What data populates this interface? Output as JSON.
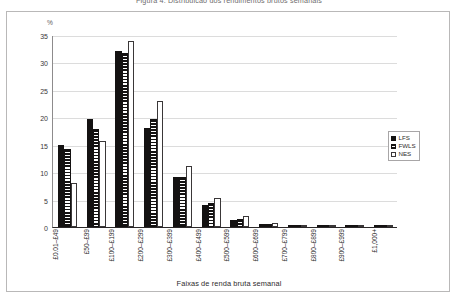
{
  "figure": {
    "title": "Figura 4: Distribuicao dos rendimentos brutos semanais",
    "y_unit_label": "%",
    "x_axis_title": "Faixas de renda bruta semanal"
  },
  "legend": {
    "position": "right",
    "entries": [
      {
        "key": "LFS",
        "label": "LFS",
        "swatch": "solid-black"
      },
      {
        "key": "FWLS",
        "label": "FWLS",
        "swatch": "horizontal-stripes"
      },
      {
        "key": "NES",
        "label": "NES",
        "swatch": "white-outline"
      }
    ]
  },
  "y_ticks": [
    "0",
    "5",
    "10",
    "15",
    "20",
    "25",
    "30",
    "35"
  ],
  "chart_data": {
    "type": "bar",
    "title": "Figura 4: Distribuicao dos rendimentos brutos semanais",
    "xlabel": "Faixas de renda bruta semanal",
    "ylabel": "%",
    "ylim": [
      0,
      35
    ],
    "ytick_step": 5,
    "grid": true,
    "legend_position": "right",
    "categories": [
      "£0.01–£49",
      "£50–£99",
      "£100–£199",
      "£200–£299",
      "£300–£399",
      "£400–£499",
      "£500–£599",
      "£600–£699",
      "£700–£799",
      "£800–£899",
      "£900–£999",
      "£1,000+"
    ],
    "series": [
      {
        "name": "LFS",
        "values": [
          15.0,
          19.7,
          32.0,
          18.0,
          9.2,
          4.0,
          1.3,
          0.5,
          0.3,
          0.2,
          0.1,
          0.3
        ]
      },
      {
        "name": "FWLS",
        "values": [
          14.3,
          17.9,
          31.7,
          19.7,
          9.2,
          4.3,
          1.5,
          0.6,
          0.3,
          0.2,
          0.1,
          0.3
        ]
      },
      {
        "name": "NES",
        "values": [
          8.1,
          15.6,
          34.0,
          22.9,
          11.1,
          5.3,
          2.0,
          0.8,
          0.4,
          0.2,
          0.2,
          0.4
        ]
      }
    ]
  }
}
